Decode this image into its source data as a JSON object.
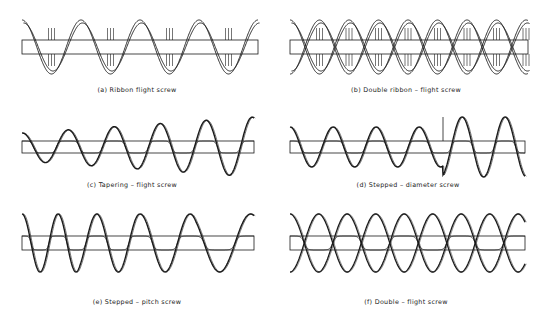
{
  "figure": {
    "panels": [
      {
        "id": "a",
        "caption": "(a) Ribbon flight screw",
        "type": "ribbon",
        "x0": 22,
        "x1": 258,
        "yc": 47,
        "shaft_half": 7,
        "amp": 27,
        "pitch": 59,
        "phase": 0,
        "double": false,
        "cap_x": 137,
        "cap_y": 86
      },
      {
        "id": "b",
        "caption": "(b) Double ribbon – flight screw",
        "type": "ribbon",
        "x0": 290,
        "x1": 528,
        "yc": 47,
        "shaft_half": 7,
        "amp": 27,
        "pitch": 59,
        "phase": 0,
        "double": true,
        "cap_x": 406,
        "cap_y": 86
      },
      {
        "id": "c",
        "caption": "(c) Tapering – flight screw",
        "type": "taper",
        "x0": 22,
        "x1": 254,
        "yc": 147,
        "shaft_half": 6,
        "amp_start": 14,
        "amp_end": 30,
        "pitch": 46,
        "phase": 0,
        "cap_x": 132,
        "cap_y": 181
      },
      {
        "id": "d",
        "caption": "(d) Stepped – diameter screw",
        "type": "stepdia",
        "x0": 290,
        "x1": 525,
        "yc": 147,
        "shaft_half": 6,
        "amp_small": 20,
        "amp_large": 30,
        "step_x": 443,
        "pitch": 43,
        "phase": 0,
        "cap_x": 408,
        "cap_y": 181
      },
      {
        "id": "e",
        "caption": "(e) Stepped – pitch screw",
        "type": "steppitch",
        "x0": 22,
        "x1": 254,
        "yc": 243,
        "shaft_half": 7,
        "amp": 29,
        "pitches": [
          36,
          43,
          50,
          62
        ],
        "cap_x": 137,
        "cap_y": 298
      },
      {
        "id": "f",
        "caption": "(f) Double – flight screw",
        "type": "double",
        "x0": 290,
        "x1": 525,
        "yc": 243,
        "shaft_half": 7,
        "amp": 29,
        "pitch": 57,
        "phase": 0,
        "cap_x": 406,
        "cap_y": 298
      }
    ]
  },
  "colors": {
    "line": "#1a1a1a",
    "background": "#ffffff"
  }
}
